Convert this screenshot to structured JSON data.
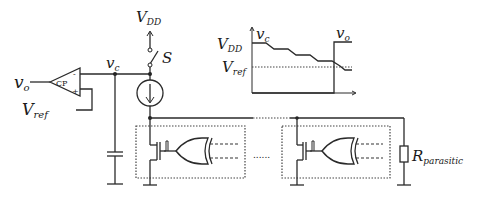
{
  "diagram": {
    "labels": {
      "vo_input": "v",
      "vo_sub": "o",
      "comparator": "CP",
      "comp_minus": "-",
      "comp_plus": "+",
      "vref": "V",
      "vref_sub": "ref",
      "vc": "v",
      "vc_sub": "c",
      "vdd": "V",
      "vdd_sub": "DD",
      "switch": "S",
      "rpar": "R",
      "rpar_sub": "parasitic",
      "ellipsis": "......"
    },
    "waveform": {
      "vdd": "V",
      "vdd_sub": "DD",
      "vref": "V",
      "vref_sub": "ref",
      "vc": "v",
      "vc_sub": "c",
      "vo": "v",
      "vo_sub": "o"
    },
    "stages": [
      {
        "name": "stage-1"
      },
      {
        "name": "stage-n"
      }
    ]
  }
}
